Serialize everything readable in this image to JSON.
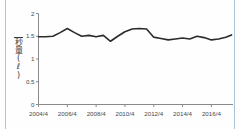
{
  "figure": {
    "background_color": "#fefefe",
    "edge_rule_color": "#aac6dd",
    "line_color": "#2b2b2b",
    "axis_color": "#8a8a8a"
  },
  "yaxis_title": {
    "full": "一秒量(ℓ)",
    "chars": [
      "一",
      "秒",
      "量",
      "(",
      "ℓ",
      ")"
    ]
  },
  "chart_data": {
    "type": "line",
    "title": "",
    "subtitle": "",
    "xlabel": "",
    "ylabel": "一秒量(ℓ)",
    "unit": "ℓ",
    "grid": false,
    "legend": "none",
    "ylim": [
      0,
      2
    ],
    "ytick_labels": [
      "0",
      "0.5",
      "1",
      "1.5",
      "2"
    ],
    "ytick_values": [
      0,
      0.5,
      1,
      1.5,
      2
    ],
    "xtick_labels": [
      "2004/4",
      "2006/4",
      "2008/4",
      "2010/4",
      "2012/4",
      "2014/4",
      "2016/4"
    ],
    "xtick_values": [
      2004,
      2006,
      2008,
      2010,
      2012,
      2014,
      2016
    ],
    "xlim": [
      2004,
      2017.5
    ],
    "x": [
      2004.0,
      2004.5,
      2005.0,
      2005.5,
      2006.0,
      2006.5,
      2007.0,
      2007.5,
      2008.0,
      2008.5,
      2009.0,
      2009.5,
      2010.0,
      2010.5,
      2011.0,
      2011.5,
      2012.0,
      2012.5,
      2013.0,
      2013.5,
      2014.0,
      2014.5,
      2015.0,
      2015.5,
      2016.0,
      2016.5,
      2017.0,
      2017.4
    ],
    "series": [
      {
        "name": "一秒量",
        "color": "#2b2b2b",
        "values": [
          1.49,
          1.49,
          1.5,
          1.58,
          1.67,
          1.58,
          1.5,
          1.52,
          1.49,
          1.52,
          1.39,
          1.5,
          1.6,
          1.66,
          1.67,
          1.66,
          1.57,
          1.52,
          1.5,
          1.52,
          1.57,
          1.55,
          1.53,
          1.51,
          1.49,
          1.47,
          1.45,
          1.44
        ]
      }
    ],
    "series_tail": {
      "name": "一秒量 (continued)",
      "x": [
        2011.5,
        2012.0,
        2012.5,
        2013.0,
        2013.5,
        2014.0,
        2014.5,
        2015.0,
        2015.5,
        2016.0,
        2016.5,
        2017.0,
        2017.4
      ],
      "values": [
        1.5,
        1.48,
        1.45,
        1.42,
        1.44,
        1.46,
        1.44,
        1.5,
        1.47,
        1.42,
        1.44,
        1.48,
        1.53
      ]
    },
    "annotations": []
  }
}
